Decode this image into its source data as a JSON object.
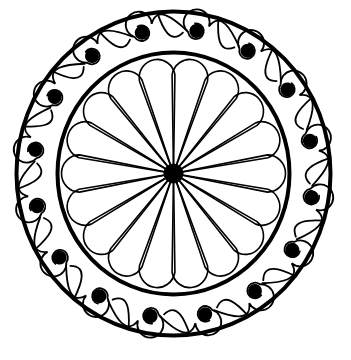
{
  "image": {
    "subject": "circular rosette ironwork design",
    "background": "#ffffff",
    "ink": "#000000"
  },
  "rosette": {
    "center": [
      173.5,
      173.5
    ],
    "outer_ring": {
      "rx": 157,
      "ry": 162,
      "stroke": 4
    },
    "inner_ring": {
      "rx": 116,
      "ry": 121,
      "stroke": 4
    },
    "hub": {
      "r": 10
    },
    "petals": {
      "count": 18,
      "length": 112,
      "half_width": 18,
      "stroke": 1.6,
      "offset_deg": 0
    },
    "scrolls": {
      "count": 16,
      "radius": 140,
      "dot_r": 7,
      "coil_r": 13,
      "offset_deg": 9.4,
      "stroke": 1.8
    }
  }
}
